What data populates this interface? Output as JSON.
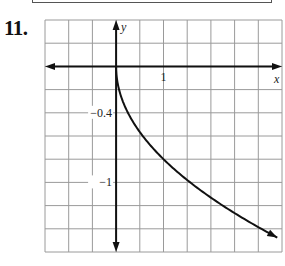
{
  "problem_number": "11.",
  "chart_data": {
    "type": "line",
    "title": "",
    "xlabel": "x",
    "ylabel": "y",
    "x_tick_labels": [
      {
        "value": 1,
        "label": "1"
      }
    ],
    "y_tick_labels": [
      {
        "value": -0.4,
        "label": "−0.4"
      },
      {
        "value": -1,
        "label": "−1"
      }
    ],
    "grid": true,
    "grid_spacing": {
      "x": 0.5,
      "y": 0.2
    },
    "xlim": [
      -1.5,
      3.5
    ],
    "ylim": [
      -1.6,
      0.4
    ],
    "series": [
      {
        "name": "curve",
        "function_approx": "y = -0.8*sqrt(x)",
        "x": [
          0,
          0.05,
          0.25,
          0.5,
          1,
          1.5,
          2,
          2.5,
          3,
          3.4
        ],
        "y": [
          0,
          -0.18,
          -0.4,
          -0.57,
          -0.8,
          -0.98,
          -1.13,
          -1.26,
          -1.39,
          -1.48
        ],
        "end_arrow": true
      }
    ],
    "colors": {
      "grid": "#9a9a9a",
      "axes": "#111111",
      "curve": "#111111"
    }
  }
}
